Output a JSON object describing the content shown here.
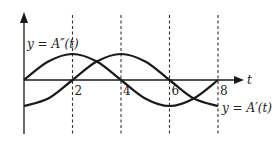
{
  "chart_data": {
    "type": "line",
    "title": "",
    "xlabel": "t",
    "ylabel": "",
    "xlim": [
      0,
      8
    ],
    "ylim": [
      -1.3,
      1.3
    ],
    "grid": false,
    "x_ticks": [
      "2",
      "4",
      "6",
      "8"
    ],
    "x_tick_values": [
      2,
      4,
      6,
      8
    ],
    "dashed_verticals": [
      2,
      4,
      6,
      8
    ],
    "series": [
      {
        "name": "y = A″(t)",
        "label": "y = A″(t)",
        "x": [
          0,
          1,
          2,
          3,
          4,
          5,
          6,
          7,
          8
        ],
        "values": [
          0,
          0.71,
          1,
          0.71,
          0,
          -0.71,
          -1,
          -0.71,
          0
        ]
      },
      {
        "name": "y = A′(t)",
        "label": "y = A′(t)",
        "x": [
          0,
          1,
          2,
          3,
          4,
          5,
          6,
          7,
          8
        ],
        "values": [
          -1,
          -0.71,
          0,
          0.71,
          1,
          0.71,
          0,
          -0.71,
          -1
        ]
      }
    ],
    "line_color": "#1a1a1a",
    "dash_color": "#333333"
  }
}
